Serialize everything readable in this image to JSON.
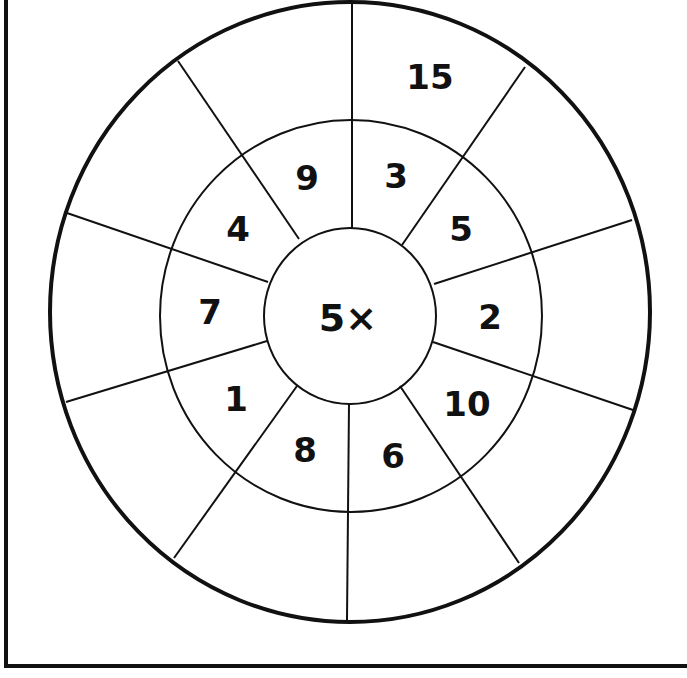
{
  "worksheet": {
    "title": "Multiplication wheel",
    "center_label": "5×",
    "multiplier": 5,
    "inner_ring": [
      "3",
      "5",
      "2",
      "10",
      "6",
      "8",
      "1",
      "7",
      "4",
      "9"
    ],
    "outer_ring": [
      "15",
      "",
      "",
      "",
      "",
      "",
      "",
      "",
      "",
      ""
    ],
    "colors": {
      "ink": "#111111",
      "paper": "#ffffff"
    }
  }
}
